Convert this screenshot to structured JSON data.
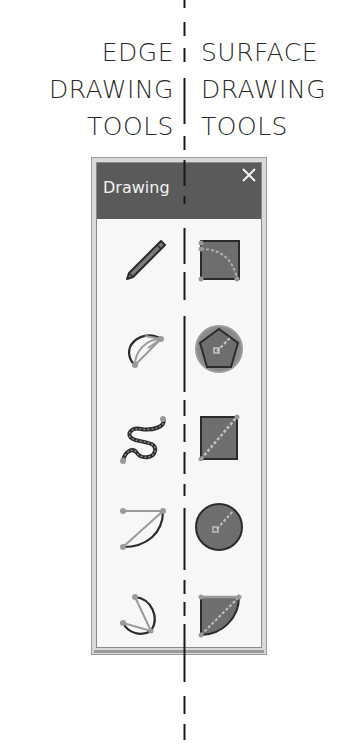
{
  "labels": {
    "left": [
      "EDGE",
      "DRAWING",
      "TOOLS"
    ],
    "right": [
      "SURFACE",
      "DRAWING",
      "TOOLS"
    ]
  },
  "panel": {
    "title": "Drawing",
    "close_icon": "close-icon",
    "edge_tools": [
      {
        "name": "freehand-line",
        "icon": "pencil-icon"
      },
      {
        "name": "arc",
        "icon": "arc-icon"
      },
      {
        "name": "curve",
        "icon": "wavy-curve-icon"
      },
      {
        "name": "two-point-arc",
        "icon": "two-point-arc-icon"
      },
      {
        "name": "three-point-arc",
        "icon": "three-point-arc-icon"
      }
    ],
    "surface_tools": [
      {
        "name": "rectangle-surface",
        "icon": "filled-rounded-rectangle-icon"
      },
      {
        "name": "polygon-surface",
        "icon": "filled-polygon-icon"
      },
      {
        "name": "rectangle",
        "icon": "filled-rectangle-icon"
      },
      {
        "name": "circle",
        "icon": "filled-circle-icon"
      },
      {
        "name": "pie",
        "icon": "filled-pie-icon"
      }
    ]
  },
  "colors": {
    "titlebar": "#5a5a5a",
    "panel_bg": "#f7f7f7",
    "icon_fill": "#6e6e6e",
    "icon_stroke": "#2b2b2b",
    "handle": "#9a9a9a",
    "divider": "#1a1a1a"
  }
}
